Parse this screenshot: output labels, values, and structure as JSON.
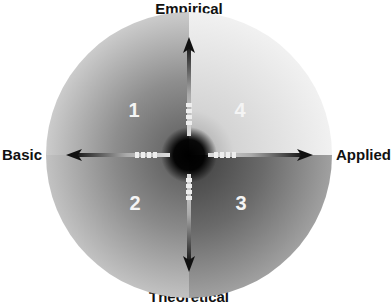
{
  "diagram": {
    "axes": {
      "top": "Empirical",
      "bottom": "Theoretical",
      "left": "Basic",
      "right": "Applied"
    },
    "quadrants": [
      {
        "number": "1",
        "position": "top-left",
        "shade": "#9a9a9a"
      },
      {
        "number": "4",
        "position": "top-right",
        "shade": "#e0e0e0"
      },
      {
        "number": "2",
        "position": "bottom-left",
        "shade": "#8c8c8c"
      },
      {
        "number": "3",
        "position": "bottom-right",
        "shade": "#6a6a6a"
      }
    ],
    "colors": {
      "arrow": "#111111",
      "center": "#050505",
      "tick": "#f0f0f0"
    }
  }
}
